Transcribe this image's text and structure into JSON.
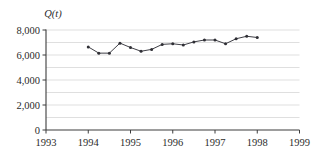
{
  "chart_data": {
    "type": "line",
    "title": "",
    "subtitle": "",
    "xlabel": "",
    "ylabel": "Q(t)",
    "y_axis_title": "Q(t)",
    "xlim": [
      1993,
      1999
    ],
    "ylim": [
      0,
      8000
    ],
    "x_ticks": [
      1993,
      1994,
      1995,
      1996,
      1997,
      1998,
      1999
    ],
    "x_tick_labels": [
      "1993",
      "1994",
      "1995",
      "1996",
      "1997",
      "1998",
      "1999"
    ],
    "y_ticks": [
      0,
      2000,
      4000,
      6000,
      8000
    ],
    "y_tick_labels": [
      "0",
      "2,000",
      "4,000",
      "6,000",
      "8,000"
    ],
    "y_minor_gridlines": [
      1000,
      2000,
      3000,
      4000,
      5000,
      6000,
      7000,
      8000
    ],
    "grid": true,
    "grid_axis": "y",
    "legend": false,
    "legend_position": "none",
    "marker": "circle",
    "line_color": "#3f3f46",
    "marker_color": "#2f2f35",
    "grid_color": "#c9c9c9",
    "axis_color": "#3c3c3c",
    "x": [
      1994.0,
      1994.25,
      1994.5,
      1994.75,
      1995.0,
      1995.25,
      1995.5,
      1995.75,
      1996.0,
      1996.25,
      1996.5,
      1996.75,
      1997.0,
      1997.25,
      1997.5,
      1997.75,
      1998.0
    ],
    "values": [
      6650,
      6150,
      6150,
      6950,
      6600,
      6300,
      6450,
      6850,
      6900,
      6800,
      7050,
      7200,
      7200,
      6900,
      7300,
      7500,
      7400
    ],
    "series": [
      {
        "name": "Q(t)",
        "x": [
          1994.0,
          1994.25,
          1994.5,
          1994.75,
          1995.0,
          1995.25,
          1995.5,
          1995.75,
          1996.0,
          1996.25,
          1996.5,
          1996.75,
          1997.0,
          1997.25,
          1997.5,
          1997.75,
          1998.0
        ],
        "values": [
          6650,
          6150,
          6150,
          6950,
          6600,
          6300,
          6450,
          6850,
          6900,
          6800,
          7050,
          7200,
          7200,
          6900,
          7300,
          7500,
          7400
        ]
      }
    ],
    "annotations": []
  }
}
